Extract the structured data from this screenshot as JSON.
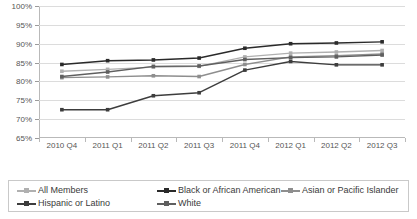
{
  "chart_data": {
    "type": "line",
    "title": "",
    "subtitle": "",
    "xlabel": "",
    "ylabel": "",
    "ylim": [
      65,
      100
    ],
    "ytick_labels": [
      "65%",
      "70%",
      "75%",
      "80%",
      "85%",
      "90%",
      "95%",
      "100%"
    ],
    "ytick_values": [
      65,
      70,
      75,
      80,
      85,
      90,
      95,
      100
    ],
    "grid": true,
    "legend_position": "bottom",
    "categories": [
      "2010 Q4",
      "2011 Q1",
      "2011 Q2",
      "2011 Q3",
      "2011 Q4",
      "2012 Q1",
      "2012 Q2",
      "2012 Q3"
    ],
    "series": [
      {
        "name": "All Members",
        "color": "#b0b0b0",
        "marker": "square",
        "values": [
          82.7,
          83.2,
          83.8,
          84.0,
          86.5,
          87.5,
          87.8,
          88.2
        ]
      },
      {
        "name": "Black or African American",
        "color": "#2a2a2a",
        "marker": "square",
        "values": [
          84.5,
          85.5,
          85.7,
          86.2,
          88.8,
          90.0,
          90.2,
          90.5
        ]
      },
      {
        "name": "Asian or Pacific Islander",
        "color": "#8e8e8e",
        "marker": "square",
        "values": [
          81.0,
          81.2,
          81.5,
          81.3,
          84.5,
          86.5,
          86.8,
          87.3
        ]
      },
      {
        "name": "Hispanic or Latino",
        "color": "#3d3d3d",
        "marker": "square",
        "values": [
          72.5,
          72.5,
          76.2,
          77.0,
          83.0,
          85.3,
          84.4,
          84.4
        ]
      },
      {
        "name": "White",
        "color": "#5f5f5f",
        "marker": "square",
        "values": [
          81.3,
          82.5,
          84.0,
          84.1,
          85.8,
          86.3,
          86.5,
          87.0
        ]
      }
    ]
  },
  "legend": {
    "items": [
      {
        "label": "All Members",
        "color": "#b0b0b0"
      },
      {
        "label": "Black or African American",
        "color": "#2a2a2a"
      },
      {
        "label": "Asian or Pacific Islander",
        "color": "#8e8e8e"
      },
      {
        "label": "Hispanic or Latino",
        "color": "#3d3d3d"
      },
      {
        "label": "White",
        "color": "#5f5f5f"
      }
    ]
  }
}
